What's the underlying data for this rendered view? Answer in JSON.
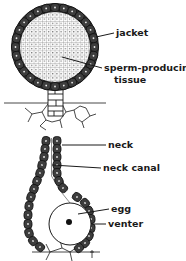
{
  "figure": {
    "type": "biological-diagram",
    "colors": {
      "background": "#ffffff",
      "ink": "#1a1a1a",
      "jacket_cell": "#3a3a3a",
      "tissue_grid": "#bdbdbd"
    }
  },
  "antheridium": {
    "labels": [
      {
        "text": "jacket",
        "x": 116,
        "y": 36
      },
      {
        "text": "sperm-producing",
        "x": 104,
        "y": 71
      },
      {
        "text": "tissue",
        "x": 114,
        "y": 83
      }
    ]
  },
  "archegonium": {
    "labels": [
      {
        "text": "neck",
        "x": 108,
        "y": 148
      },
      {
        "text": "neck canal",
        "x": 103,
        "y": 171
      },
      {
        "text": "egg",
        "x": 111,
        "y": 212
      },
      {
        "text": "venter",
        "x": 108,
        "y": 227
      }
    ]
  }
}
